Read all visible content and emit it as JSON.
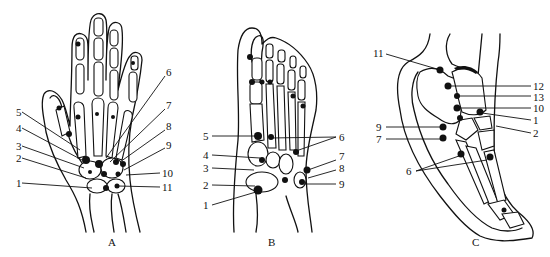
{
  "figure": {
    "panels": [
      {
        "id": "A",
        "caption": "A",
        "subject": "hand (dorsal view)",
        "labels": [
          "1",
          "2",
          "3",
          "4",
          "5",
          "6",
          "7",
          "8",
          "9",
          "10",
          "11"
        ]
      },
      {
        "id": "B",
        "caption": "B",
        "subject": "foot (dorsal view)",
        "labels": [
          "1",
          "2",
          "3",
          "4",
          "5",
          "6",
          "7",
          "8",
          "9"
        ]
      },
      {
        "id": "C",
        "caption": "C",
        "subject": "foot (lateral view)",
        "labels": [
          "1",
          "2",
          "6",
          "7",
          "9",
          "10",
          "11",
          "12",
          "13"
        ]
      }
    ]
  },
  "panelA": {
    "caption": "A",
    "l1": "1",
    "l2": "2",
    "l3": "3",
    "l4": "4",
    "l5": "5",
    "l6": "6",
    "l7": "7",
    "l8": "8",
    "l9": "9",
    "l10": "10",
    "l11": "11"
  },
  "panelB": {
    "caption": "B",
    "l1": "1",
    "l2": "2",
    "l3": "3",
    "l4": "4",
    "l5": "5",
    "l6": "6",
    "l7": "7",
    "l8": "8",
    "l9": "9"
  },
  "panelC": {
    "caption": "C",
    "l1": "1",
    "l2": "2",
    "l6": "6",
    "l7": "7",
    "l9": "9",
    "l10": "10",
    "l11": "11",
    "l12": "12",
    "l13": "13"
  }
}
